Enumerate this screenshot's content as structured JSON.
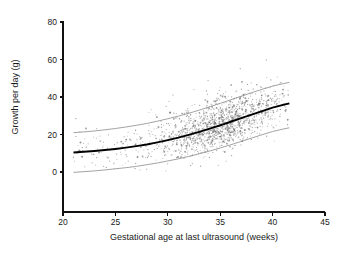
{
  "figure": {
    "background_color": "#ffffff",
    "point_color": "#6e6e6e",
    "fit_color": "#000000",
    "band_color": "#8c8c8c",
    "axis_color": "#111111"
  },
  "chart_data": {
    "type": "scatter",
    "title": "",
    "subtitle": "",
    "xlabel": "Gestational age at last ultrasound (weeks)",
    "ylabel": "Growth per day (g)",
    "xlim": [
      20,
      45
    ],
    "ylim": [
      0,
      80
    ],
    "xticks": [
      20,
      25,
      30,
      35,
      40,
      45
    ],
    "yticks": [
      0,
      20,
      40,
      60,
      80
    ],
    "xtick_labels": [
      "20",
      "25",
      "30",
      "35",
      "40",
      "45"
    ],
    "ytick_labels": [
      "0",
      "20",
      "40",
      "60",
      "80"
    ],
    "grid": false,
    "legend": null,
    "legend_position": "none",
    "annotations": [],
    "n_points": 1500,
    "point_marker": "dot",
    "point_size": 0.75,
    "scatter_domain": [
      21.0,
      41.6
    ],
    "density_peak_x": 35.0,
    "density_sigma_x": 2.9,
    "residual_sd": 6.2,
    "scatter_note": "Dense cloud of observations, densest between 33 and 37 weeks, sparse tail below 27 weeks, occasional high outliers reaching about 70 g per day.",
    "series": [
      {
        "name": "Fitted mean growth",
        "style": "bold-black-curve",
        "x": [
          21.0,
          22.0,
          23.0,
          24.0,
          25.0,
          26.0,
          27.0,
          28.0,
          29.0,
          30.0,
          31.0,
          32.0,
          33.0,
          34.0,
          35.0,
          36.0,
          37.0,
          38.0,
          39.0,
          40.0,
          41.0,
          41.6
        ],
        "values": [
          10.4,
          10.8,
          11.2,
          11.7,
          12.3,
          13.0,
          13.8,
          14.7,
          15.8,
          17.0,
          18.3,
          19.8,
          21.4,
          23.1,
          24.9,
          26.8,
          28.7,
          30.6,
          32.5,
          34.3,
          35.8,
          36.6
        ]
      },
      {
        "name": "Upper reference limit",
        "style": "thin-grey-curve",
        "x": [
          21.0,
          22.0,
          23.0,
          24.0,
          25.0,
          26.0,
          27.0,
          28.0,
          29.0,
          30.0,
          31.0,
          32.0,
          33.0,
          34.0,
          35.0,
          36.0,
          37.0,
          38.0,
          39.0,
          40.0,
          41.0,
          41.6
        ],
        "values": [
          21.0,
          21.4,
          21.9,
          22.5,
          23.2,
          24.0,
          24.9,
          25.9,
          27.1,
          28.4,
          29.8,
          31.3,
          33.0,
          34.8,
          36.6,
          38.5,
          40.4,
          42.3,
          44.1,
          45.8,
          47.1,
          47.8
        ]
      },
      {
        "name": "Lower reference limit",
        "style": "thin-grey-curve",
        "x": [
          21.0,
          22.0,
          23.0,
          24.0,
          25.0,
          26.0,
          27.0,
          28.0,
          29.0,
          30.0,
          31.0,
          32.0,
          33.0,
          34.0,
          35.0,
          36.0,
          37.0,
          38.0,
          39.0,
          40.0,
          41.0,
          41.6
        ],
        "values": [
          -0.2,
          0.2,
          0.6,
          1.1,
          1.7,
          2.3,
          3.0,
          3.9,
          4.8,
          5.9,
          7.0,
          8.3,
          9.7,
          11.2,
          12.8,
          14.5,
          16.3,
          18.1,
          19.9,
          21.6,
          22.9,
          23.6
        ]
      }
    ]
  }
}
